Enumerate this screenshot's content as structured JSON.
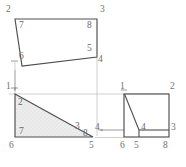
{
  "drawing": {
    "title": "Orthographic projection – three views of a wedge block",
    "background_color": "#ffffff",
    "line_color": "#4a4a4a",
    "projection_line_color": "#b9b9b9",
    "shade_fill_color": "#ececec",
    "shade_dot_color": "#cfcfcf",
    "label_color": "#5b5b5b",
    "views": [
      {
        "name": "top-view",
        "shape": "quadrilateral",
        "outline_points": "15,19 97,19 97,57 22,66",
        "corner_labels": [
          {
            "text": "7",
            "x": 19,
            "y": 22,
            "kind": "inner"
          },
          {
            "text": "8",
            "x": 87,
            "y": 22,
            "kind": "inner"
          },
          {
            "text": "5",
            "x": 87,
            "y": 46,
            "kind": "inner"
          },
          {
            "text": "6",
            "x": 19,
            "y": 54,
            "kind": "inner"
          }
        ],
        "outer_labels": [
          {
            "text": "2",
            "x": 6,
            "y": 6,
            "kind": "outer"
          },
          {
            "text": "3",
            "x": 100,
            "y": 6,
            "kind": "outer"
          },
          {
            "text": "4",
            "x": 98,
            "y": 58,
            "kind": "outer"
          }
        ]
      },
      {
        "name": "front-view",
        "shape": "right-triangle-shaded",
        "outline_points": "15,94 93,137 15,137",
        "shaded": true,
        "corner_labels": [
          {
            "text": "2",
            "x": 18,
            "y": 99,
            "kind": "inner"
          },
          {
            "text": "3",
            "x": 75,
            "y": 124,
            "kind": "inner"
          },
          {
            "text": "8",
            "x": 84,
            "y": 130,
            "kind": "inner"
          },
          {
            "text": "7",
            "x": 19,
            "y": 128,
            "kind": "inner"
          }
        ],
        "outer_labels": [
          {
            "text": "1",
            "x": 6,
            "y": 84,
            "kind": "outer"
          },
          {
            "text": "4",
            "x": 95,
            "y": 125,
            "kind": "outer"
          },
          {
            "text": "6",
            "x": 10,
            "y": 143,
            "kind": "outer"
          },
          {
            "text": "5",
            "x": 89,
            "y": 143,
            "kind": "outer"
          }
        ]
      },
      {
        "name": "side-view",
        "shape": "rectangle-with-wedge",
        "outline_points": "124,94 169,94 169,137 124,137",
        "internal_lines": [
          {
            "name": "wedge-diagonal",
            "x1": 124,
            "y1": 94,
            "x2": 139,
            "y2": 130
          },
          {
            "name": "wedge-vertical",
            "x1": 139,
            "y1": 130,
            "x2": 139,
            "y2": 137
          },
          {
            "name": "wedge-horizontal",
            "x1": 139,
            "y1": 130,
            "x2": 169,
            "y2": 130
          }
        ],
        "corner_labels": [
          {
            "text": "4",
            "x": 141,
            "y": 125,
            "kind": "inner"
          }
        ],
        "outer_labels": [
          {
            "text": "1",
            "x": 121,
            "y": 84,
            "kind": "outer"
          },
          {
            "text": "2",
            "x": 171,
            "y": 84,
            "kind": "outer"
          },
          {
            "text": "3",
            "x": 172,
            "y": 125,
            "kind": "outer"
          },
          {
            "text": "6",
            "x": 120,
            "y": 143,
            "kind": "outer"
          },
          {
            "text": "5",
            "x": 134,
            "y": 143,
            "kind": "outer"
          },
          {
            "text": "8",
            "x": 163,
            "y": 143,
            "kind": "outer"
          }
        ]
      }
    ],
    "projection_lines": [
      {
        "name": "proj-vertical-left",
        "x1": 15,
        "y1": 66,
        "x2": 15,
        "y2": 92
      },
      {
        "name": "proj-vertical-right",
        "x1": 97,
        "y1": 57,
        "x2": 97,
        "y2": 137
      },
      {
        "name": "proj-horizontal-top",
        "x1": 10,
        "y1": 94,
        "x2": 169,
        "y2": 94
      },
      {
        "name": "proj-horizontal-bottom",
        "x1": 93,
        "y1": 137,
        "x2": 169,
        "y2": 137
      },
      {
        "name": "proj-horizontal-mid",
        "x1": 96,
        "y1": 130,
        "x2": 169,
        "y2": 130
      }
    ],
    "arrows": [
      {
        "name": "arrow-left-4",
        "x1": 150,
        "y1": 130,
        "x2": 96,
        "y2": 130,
        "direction": "left"
      },
      {
        "name": "arrow-down-1",
        "x1": 15,
        "y1": 70,
        "x2": 15,
        "y2": 92,
        "direction": "down"
      }
    ],
    "tick_marks": [
      {
        "name": "tick-top-left",
        "x": 15,
        "y": 61
      },
      {
        "name": "tick-front-left",
        "x": 15,
        "y": 88
      }
    ]
  }
}
